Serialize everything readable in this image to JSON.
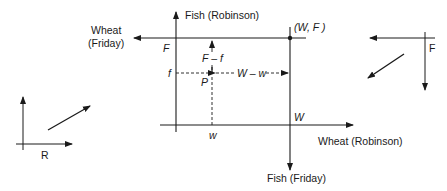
{
  "diagram": {
    "type": "edgeworth-box",
    "colors": {
      "ink": "#1a1a1a",
      "background": "#ffffff"
    },
    "main": {
      "robinson_axes": {
        "vertical_label": "Fish (Robinson)",
        "horizontal_label": "Wheat (Robinson)"
      },
      "friday_axes": {
        "horizontal_label_line1": "Wheat",
        "horizontal_label_line2": "(Friday)",
        "vertical_label": "Fish (Friday)"
      },
      "labels": {
        "endowment_point": "(W, F )",
        "F": "F",
        "f": "f",
        "P": "P",
        "W": "W",
        "w": "w",
        "F_minus_f": "F – f",
        "W_minus_w": "W – w"
      }
    },
    "inset_robinson": {
      "label": "R"
    },
    "inset_friday": {
      "label": "F"
    }
  }
}
